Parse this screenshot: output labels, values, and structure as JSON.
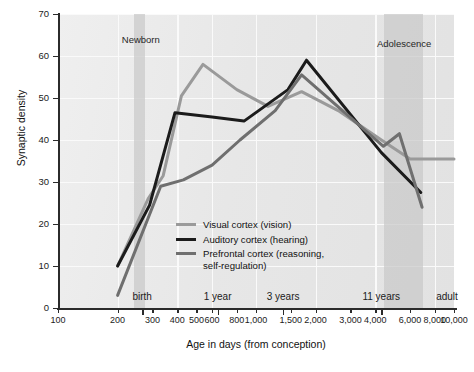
{
  "chart_data": {
    "type": "line",
    "title": "",
    "xlabel": "Age in days (from conception)",
    "ylabel": "Synaptic density",
    "xscale": "log",
    "xlim": [
      100,
      10000
    ],
    "ylim": [
      0,
      70
    ],
    "grid": true,
    "legend_position": "inside-center",
    "y_ticks": [
      0,
      10,
      20,
      30,
      40,
      50,
      60,
      70
    ],
    "x_ticks": [
      100,
      200,
      300,
      400,
      500,
      600,
      800,
      1000,
      1500,
      2000,
      3000,
      4000,
      6000,
      8000,
      10000
    ],
    "x_tick_labels": [
      "100",
      "200",
      "300",
      "400",
      "500",
      "600",
      "800",
      "1,000",
      "1,500",
      "2,000",
      "3,000",
      "4,000",
      "6,000",
      "8,000",
      "10,000"
    ],
    "era_markers": [
      {
        "label": "birth",
        "x": 266
      },
      {
        "label": "1 year",
        "x": 640
      },
      {
        "label": "3 years",
        "x": 1370
      },
      {
        "label": "11 years",
        "x": 4290
      },
      {
        "label": "adult",
        "x": 9600
      }
    ],
    "bands": [
      {
        "label": "Newborn",
        "x0": 243,
        "x1": 276,
        "label_x": 262,
        "label_y_px": 34
      },
      {
        "label": "Adolescence",
        "x0": 4450,
        "x1": 7000,
        "label_x": 5600,
        "label_y_px": 38
      }
    ],
    "series": [
      {
        "name": "Visual cortex (vision)",
        "color": "#9a9a9a",
        "points": [
          {
            "x": 200,
            "y": 10
          },
          {
            "x": 285,
            "y": 26
          },
          {
            "x": 340,
            "y": 31.5
          },
          {
            "x": 420,
            "y": 50.5
          },
          {
            "x": 540,
            "y": 58
          },
          {
            "x": 800,
            "y": 52
          },
          {
            "x": 1150,
            "y": 48
          },
          {
            "x": 1700,
            "y": 51.5
          },
          {
            "x": 2600,
            "y": 47
          },
          {
            "x": 4300,
            "y": 40
          },
          {
            "x": 6000,
            "y": 35.5
          },
          {
            "x": 10000,
            "y": 35.5
          }
        ]
      },
      {
        "name": "Auditory cortex (hearing)",
        "color": "#1b1b1b",
        "points": [
          {
            "x": 200,
            "y": 10
          },
          {
            "x": 290,
            "y": 24.5
          },
          {
            "x": 390,
            "y": 46.5
          },
          {
            "x": 600,
            "y": 45.5
          },
          {
            "x": 870,
            "y": 44.5
          },
          {
            "x": 1450,
            "y": 52
          },
          {
            "x": 1800,
            "y": 59
          },
          {
            "x": 4300,
            "y": 37
          },
          {
            "x": 6800,
            "y": 27.5
          }
        ]
      },
      {
        "name": "Prefrontal cortex (reasoning, self-regulation)",
        "color": "#6f6f6f",
        "points": [
          {
            "x": 200,
            "y": 3
          },
          {
            "x": 330,
            "y": 29
          },
          {
            "x": 430,
            "y": 30.5
          },
          {
            "x": 600,
            "y": 34
          },
          {
            "x": 830,
            "y": 40
          },
          {
            "x": 1250,
            "y": 47
          },
          {
            "x": 1700,
            "y": 55.5
          },
          {
            "x": 4400,
            "y": 38.5
          },
          {
            "x": 5300,
            "y": 41.5
          },
          {
            "x": 6900,
            "y": 24
          }
        ]
      }
    ],
    "legend": [
      {
        "label": "Visual cortex (vision)",
        "color": "#9a9a9a"
      },
      {
        "label": "Auditory cortex (hearing)",
        "color": "#1b1b1b"
      },
      {
        "label": "Prefrontal cortex (reasoning,",
        "label2": "self-regulation)",
        "color": "#6f6f6f"
      }
    ]
  }
}
